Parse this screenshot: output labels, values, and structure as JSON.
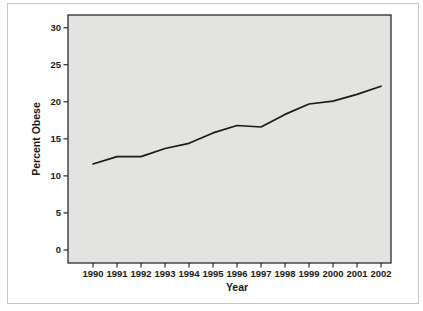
{
  "figure": {
    "kind": "static-statistical-chart"
  },
  "chart_data": {
    "type": "line",
    "title": "",
    "xlabel": "Year",
    "ylabel": "Percent Obese",
    "categories": [
      "1990",
      "1991",
      "1992",
      "1993",
      "1994",
      "1995",
      "1996",
      "1997",
      "1998",
      "1999",
      "2000",
      "2001",
      "2002"
    ],
    "values": [
      11.6,
      12.6,
      12.6,
      13.7,
      14.4,
      15.8,
      16.8,
      16.6,
      18.3,
      19.7,
      20.1,
      21.0,
      22.1
    ],
    "ylim": [
      0,
      30
    ],
    "yticks": [
      0,
      5,
      10,
      15,
      20,
      25,
      30
    ],
    "grid": "off",
    "legend": "none",
    "colors": {
      "line": "#1a1a1a",
      "plot_background": "#e3e3e1",
      "plot_border": "#2b2b2b",
      "tick": "#2b2b2b",
      "text": "#1a1a1a",
      "outer_frame": "#c6c6c6",
      "page_background": "#ffffff"
    }
  }
}
